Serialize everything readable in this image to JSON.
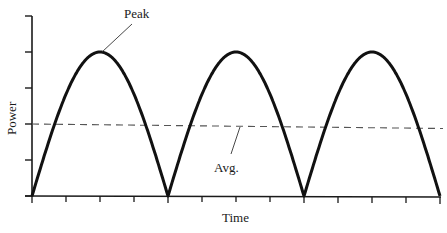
{
  "diagram": {
    "title": "",
    "type": "full-wave rectified sine power waveform",
    "labels": {
      "y_axis": "Power",
      "x_axis": "Time",
      "peak": "Peak",
      "average": "Avg."
    },
    "colors": {
      "curve": "#111111",
      "axis": "#1a1a1a",
      "average_line": "#555555",
      "background": "#ffffff"
    }
  },
  "chart_data": {
    "type": "line",
    "title": "",
    "xlabel": "Time",
    "ylabel": "Power",
    "y_ticks_count": 6,
    "x_ticks_count": 13,
    "x_tick_labels": [],
    "y_tick_labels": [],
    "series": [
      {
        "name": "Power",
        "shape": "abs(sin)",
        "humps": 3,
        "peak_value_units": 4,
        "zero_crossings_x_ticks": [
          0,
          4,
          8,
          12
        ],
        "peaks_x_ticks": [
          2,
          6,
          10
        ]
      },
      {
        "name": "Avg.",
        "style": "dashed",
        "value_units": 2
      }
    ],
    "annotations": [
      {
        "text": "Peak",
        "points_to": "first peak"
      },
      {
        "text": "Avg.",
        "points_to": "average dashed line"
      }
    ],
    "ylim": [
      0,
      5
    ],
    "grid": false,
    "legend": "none"
  }
}
